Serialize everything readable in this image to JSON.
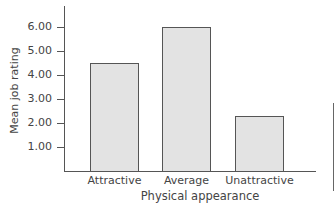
{
  "chart_data": {
    "type": "bar",
    "title": "",
    "xlabel": "Physical appearance",
    "ylabel": "Mean job rating",
    "categories": [
      "Attractive",
      "Average",
      "Unattractive"
    ],
    "values": [
      4.5,
      6.0,
      2.3
    ],
    "yticks": [
      "1.00",
      "2.00",
      "3.00",
      "4.00",
      "5.00",
      "6.00"
    ],
    "ylim": [
      0,
      6.5
    ],
    "grid": false,
    "legend": null
  },
  "colors": {
    "bar_fill": "#e3e3e3",
    "bar_edge": "#555555",
    "axis": "#555555"
  }
}
